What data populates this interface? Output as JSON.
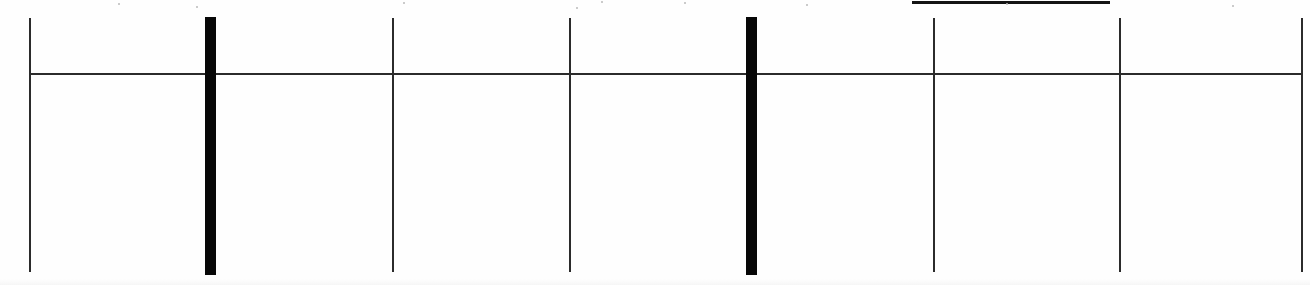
{
  "document": {
    "kind": "scanned-table-grid-fragment",
    "page_background": "#ffffff",
    "ink_color": "#1a1a1a",
    "thin_rule_color": "#2b2b2b",
    "heavy_rule_color": "#070707",
    "caption": "",
    "visible_text": "",
    "notes": "No legible text is rendered in this crop; only ruled lines and a clipped underline fragment are visible."
  },
  "grid": {
    "header_rule": {
      "label": "horizontal-header-rule",
      "x": 29,
      "y": 73,
      "width": 1274,
      "height": 2,
      "color": "#2b2b2b"
    },
    "clipped_underline": {
      "label": "clipped-underline-fragment",
      "x": 912,
      "y": 1,
      "width": 198,
      "height": 3,
      "color": "#141414"
    },
    "columns": [
      {
        "name": "column-rule-1",
        "weight": "thin",
        "x": 29,
        "y": 18,
        "width": 2,
        "height": 254,
        "color": "#2b2b2b"
      },
      {
        "name": "column-rule-2",
        "weight": "heavy",
        "x": 205,
        "y": 17,
        "width": 11,
        "height": 258,
        "color": "#070707"
      },
      {
        "name": "column-rule-3",
        "weight": "thin",
        "x": 392,
        "y": 18,
        "width": 2,
        "height": 254,
        "color": "#2b2b2b"
      },
      {
        "name": "column-rule-4",
        "weight": "thin",
        "x": 569,
        "y": 18,
        "width": 2,
        "height": 254,
        "color": "#2b2b2b"
      },
      {
        "name": "column-rule-5",
        "weight": "heavy",
        "x": 746,
        "y": 17,
        "width": 11,
        "height": 258,
        "color": "#070707"
      },
      {
        "name": "column-rule-6",
        "weight": "thin",
        "x": 933,
        "y": 18,
        "width": 2,
        "height": 254,
        "color": "#2b2b2b"
      },
      {
        "name": "column-rule-7",
        "weight": "thin",
        "x": 1119,
        "y": 18,
        "width": 2,
        "height": 254,
        "color": "#2b2b2b"
      },
      {
        "name": "column-rule-8",
        "weight": "thin",
        "x": 1301,
        "y": 18,
        "width": 2,
        "height": 254,
        "color": "#2b2b2b"
      }
    ]
  },
  "artifacts": {
    "specks": [
      {
        "x": 118,
        "y": 3
      },
      {
        "x": 403,
        "y": 2
      },
      {
        "x": 601,
        "y": 1
      },
      {
        "x": 684,
        "y": 2
      },
      {
        "x": 806,
        "y": 4
      },
      {
        "x": 1006,
        "y": 3
      },
      {
        "x": 1232,
        "y": 5
      },
      {
        "x": 196,
        "y": 6
      },
      {
        "x": 576,
        "y": 7
      }
    ]
  }
}
